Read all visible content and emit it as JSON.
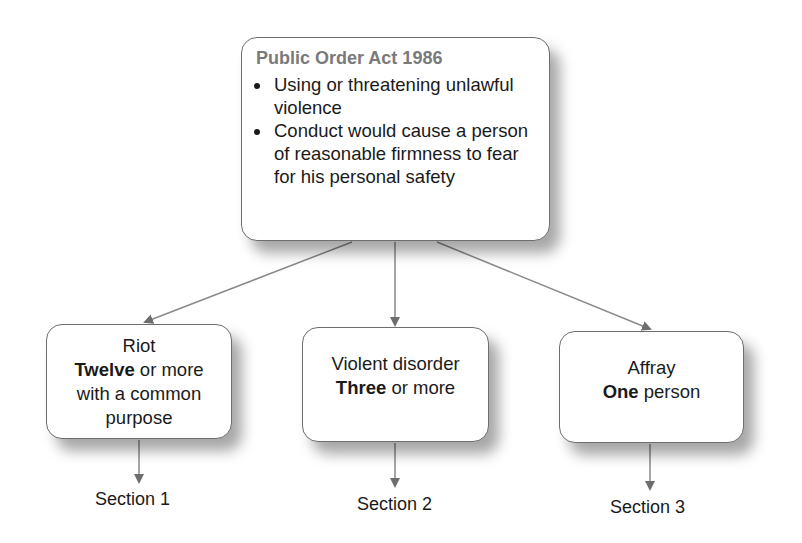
{
  "diagram": {
    "root": {
      "title": "Public Order Act 1986",
      "bullets": [
        "Using or threatening unlawful violence",
        "Conduct would cause a person of reasonable firmness to fear for his personal safety"
      ]
    },
    "children": [
      {
        "name": "Riot",
        "qualifier_bold": "Twelve",
        "qualifier_rest": " or more",
        "extra": "with a common purpose",
        "section": "Section 1"
      },
      {
        "name": "Violent disorder",
        "qualifier_bold": "Three",
        "qualifier_rest": " or more",
        "section": "Section 2"
      },
      {
        "name": "Affray",
        "qualifier_bold": "One",
        "qualifier_rest": " person",
        "section": "Section 3"
      }
    ],
    "colors": {
      "arrow": "#7a7a7a",
      "title": "#7a7a7a",
      "border": "#6e6e6e"
    }
  }
}
